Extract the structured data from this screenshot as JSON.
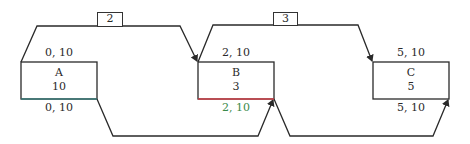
{
  "diagram": {
    "type": "precedence-network",
    "nodes": [
      {
        "id": "A",
        "name": "A",
        "duration": "10",
        "top_label": "0, 10",
        "bottom_label": "0, 10"
      },
      {
        "id": "B",
        "name": "B",
        "duration": "3",
        "top_label": "2, 10",
        "bottom_label": "2, 10"
      },
      {
        "id": "C",
        "name": "C",
        "duration": "5",
        "top_label": "5, 10",
        "bottom_label": "5, 10"
      }
    ],
    "links": [
      {
        "from": "A",
        "to": "B",
        "kind": "start-to-start",
        "lag": "2"
      },
      {
        "from": "B",
        "to": "C",
        "kind": "start-to-start",
        "lag": "3"
      },
      {
        "from": "A",
        "to": "B",
        "kind": "finish-to-finish",
        "lag": ""
      },
      {
        "from": "B",
        "to": "C",
        "kind": "finish-to-finish",
        "lag": ""
      }
    ],
    "colors": {
      "line": "#2a2a2a",
      "edge_A_bottom": "#3a7a78",
      "edge_B_bottom": "#d0404a",
      "label_B_bottom": "#3a8a4a"
    }
  }
}
